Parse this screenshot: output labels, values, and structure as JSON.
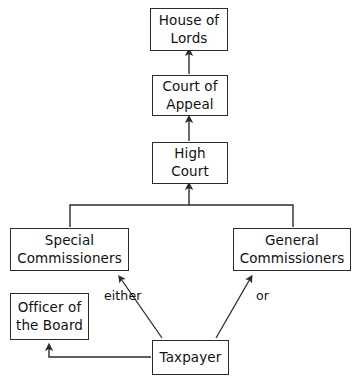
{
  "diagram": {
    "type": "flow-hierarchy",
    "background_color": "#ffffff",
    "stroke_color": "#2b2b2b",
    "text_color": "#111111",
    "nodes": [
      {
        "id": "house-of-lords",
        "line1": "House of",
        "line2": "Lords"
      },
      {
        "id": "court-of-appeal",
        "line1": "Court of",
        "line2": "Appeal"
      },
      {
        "id": "high-court",
        "line1": "High",
        "line2": "Court"
      },
      {
        "id": "special-commissioners",
        "line1": "Special",
        "line2": "Commissioners"
      },
      {
        "id": "general-commissioners",
        "line1": "General",
        "line2": "Commissioners"
      },
      {
        "id": "officer-of-the-board",
        "line1": "Officer of",
        "line2": "the Board"
      },
      {
        "id": "taxpayer",
        "line1": "Taxpayer",
        "line2": ""
      }
    ],
    "edge_labels": [
      {
        "id": "either",
        "text": "either"
      },
      {
        "id": "or",
        "text": "or"
      }
    ],
    "edges": [
      {
        "from": "court-of-appeal",
        "to": "house-of-lords",
        "arrow": "up"
      },
      {
        "from": "high-court",
        "to": "court-of-appeal",
        "arrow": "up"
      },
      {
        "from": "special-commissioners",
        "to": "high-court",
        "arrow": "up"
      },
      {
        "from": "general-commissioners",
        "to": "high-court",
        "arrow": "up"
      },
      {
        "from": "taxpayer",
        "to": "special-commissioners",
        "arrow": "up-left",
        "label": "either"
      },
      {
        "from": "taxpayer",
        "to": "general-commissioners",
        "arrow": "up-right",
        "label": "or"
      },
      {
        "from": "taxpayer",
        "to": "officer-of-the-board",
        "arrow": "left-up"
      }
    ]
  }
}
